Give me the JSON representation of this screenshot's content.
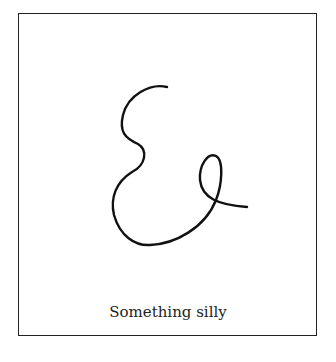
{
  "caption": "Something silly",
  "drawing": {
    "name": "ampersand-scribble",
    "stroke_color": "#111111"
  }
}
